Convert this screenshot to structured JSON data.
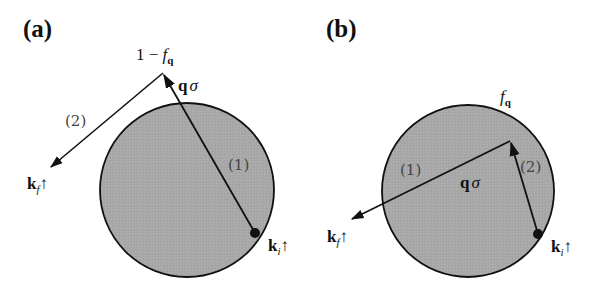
{
  "panels": [
    {
      "id": "a",
      "label": "(a)",
      "circle": {
        "cx": 187,
        "cy": 190,
        "r": 87
      },
      "apex_label": {
        "prefix": "1 − ",
        "f": "f",
        "sub": "q"
      },
      "q_sigma": {
        "q": "q",
        "sigma": "σ"
      },
      "step1": "(1)",
      "step2": "(2)",
      "kf": {
        "k": "k",
        "sub": "f",
        "spin": "↑"
      },
      "ki": {
        "k": "k",
        "sub": "i",
        "spin": "↑"
      }
    },
    {
      "id": "b",
      "label": "(b)",
      "circle": {
        "cx": 468,
        "cy": 191,
        "r": 86
      },
      "f_label": {
        "f": "f",
        "sub": "q"
      },
      "q_sigma": {
        "q": "q",
        "sigma": "σ"
      },
      "step1": "(1)",
      "step2": "(2)",
      "kf": {
        "k": "k",
        "sub": "f",
        "spin": "↑"
      },
      "ki": {
        "k": "k",
        "sub": "i",
        "spin": "↑"
      }
    }
  ],
  "colors": {
    "fill": "#a9a9a9",
    "stroke": "#111111"
  }
}
